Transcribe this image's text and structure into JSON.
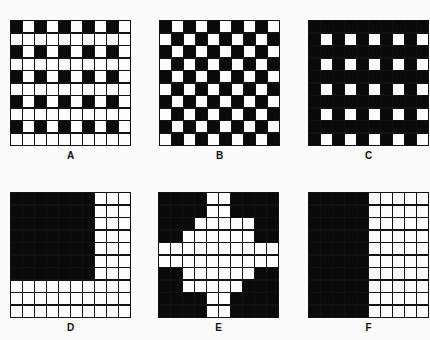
{
  "figure": {
    "panels": [
      {
        "id": "A",
        "label": "A",
        "rows": 10,
        "cols": 10,
        "description": "black squares at even rows & even columns, white grid otherwise",
        "pattern": [
          "B.B.B.B.B.",
          "..........",
          "B.B.B.B.B.",
          "..........",
          "B.B.B.B.B.",
          "..........",
          "B.B.B.B.B.",
          "..........",
          "B.B.B.B.B.",
          ".........."
        ]
      },
      {
        "id": "B",
        "label": "B",
        "rows": 10,
        "cols": 10,
        "description": "checkerboard",
        "pattern": [
          "B.B.B.B.B.",
          ".B.B.B.B.B",
          "B.B.B.B.B.",
          ".B.B.B.B.B",
          "B.B.B.B.B.",
          ".B.B.B.B.B",
          "B.B.B.B.B.",
          ".B.B.B.B.B",
          "B.B.B.B.B.",
          ".B.B.B.B.B"
        ]
      },
      {
        "id": "C",
        "label": "C",
        "rows": 10,
        "cols": 10,
        "description": "black field with white squares at odd rows & odd columns",
        "pattern": [
          "BBBBBBBBBB",
          "B.B.B.B.B.",
          "BBBBBBBBBB",
          "B.B.B.B.B.",
          "BBBBBBBBBB",
          "B.B.B.B.B.",
          "BBBBBBBBBB",
          "B.B.B.B.B.",
          "BBBBBBBBBB",
          "B.B.B.B.B."
        ]
      },
      {
        "id": "D",
        "label": "D",
        "rows": 10,
        "cols": 10,
        "description": "7x7 black block in upper-left corner",
        "pattern": [
          "BBBBBBB...",
          "BBBBBBB...",
          "BBBBBBB...",
          "BBBBBBB...",
          "BBBBBBB...",
          "BBBBBBB...",
          "BBBBBBB...",
          "..........",
          "..........",
          ".........."
        ]
      },
      {
        "id": "E",
        "label": "E",
        "rows": 10,
        "cols": 10,
        "description": "white cross/diamond shape on black field",
        "pattern": [
          "BBBB..BBBB",
          "BBBB..BBBB",
          "BBB.....BB",
          "BB......BB",
          "..........",
          "..........",
          "BB......BB",
          "BB.....BBB",
          "BBBB..BBBB",
          "BBBB..BBBB"
        ]
      },
      {
        "id": "F",
        "label": "F",
        "rows": 10,
        "cols": 10,
        "description": "left half black, right half white grid",
        "pattern": [
          "BBBBB.....",
          "BBBBB.....",
          "BBBBB.....",
          "BBBBB.....",
          "BBBBB.....",
          "BBBBB.....",
          "BBBBB.....",
          "BBBBB.....",
          "BBBBB.....",
          "BBBBB....."
        ]
      }
    ],
    "colors": {
      "black": "#0a0a0a",
      "white": "#fdfdfd",
      "grid_line": "#111111"
    }
  }
}
